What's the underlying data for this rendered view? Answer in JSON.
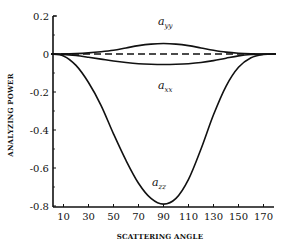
{
  "chart_data": {
    "type": "line",
    "title": "",
    "xlabel": "SCATTERING ANGLE",
    "ylabel": "ANALYZING POWER",
    "xlim": [
      0,
      180
    ],
    "ylim": [
      -0.8,
      0.2
    ],
    "x_ticks": [
      10,
      30,
      50,
      70,
      90,
      110,
      130,
      150,
      170
    ],
    "x_tick_labels": [
      "10",
      "30",
      "50",
      "70",
      "90",
      "110",
      "130",
      "150",
      "170"
    ],
    "y_ticks": [
      0.2,
      0,
      -0.2,
      -0.4,
      -0.6,
      -0.8
    ],
    "y_tick_labels": [
      "0.2",
      "0",
      "-0.2",
      "-0.4",
      "-0.6",
      "-0.8"
    ],
    "grid": false,
    "legend": "inline curve labels",
    "x": [
      0,
      10,
      20,
      30,
      40,
      50,
      60,
      70,
      80,
      90,
      100,
      110,
      120,
      130,
      140,
      150,
      160,
      170,
      180
    ],
    "series": [
      {
        "name": "a_yy",
        "label_main": "a",
        "label_sub": "yy",
        "style": "solid",
        "values": [
          0,
          0.0,
          0.002,
          0.006,
          0.012,
          0.02,
          0.032,
          0.044,
          0.052,
          0.055,
          0.052,
          0.044,
          0.032,
          0.02,
          0.01,
          0.004,
          0.001,
          0.0,
          0
        ]
      },
      {
        "name": "a_xx",
        "label_main": "a",
        "label_sub": "xx",
        "style": "solid",
        "values": [
          0,
          -0.002,
          -0.008,
          -0.017,
          -0.027,
          -0.037,
          -0.045,
          -0.051,
          -0.054,
          -0.055,
          -0.054,
          -0.051,
          -0.045,
          -0.035,
          -0.022,
          -0.01,
          -0.003,
          -0.0005,
          0
        ]
      },
      {
        "name": "reference zero",
        "style": "dashed",
        "values": [
          0,
          0,
          0,
          0,
          0,
          0,
          0,
          0,
          0,
          0,
          0,
          0,
          0,
          0,
          0,
          0,
          0,
          0,
          0
        ]
      },
      {
        "name": "a_zz",
        "label_main": "a",
        "label_sub": "zz",
        "style": "solid",
        "values": [
          0,
          -0.01,
          -0.06,
          -0.15,
          -0.27,
          -0.42,
          -0.56,
          -0.68,
          -0.76,
          -0.79,
          -0.76,
          -0.66,
          -0.5,
          -0.32,
          -0.17,
          -0.07,
          -0.02,
          -0.003,
          0
        ]
      }
    ]
  }
}
